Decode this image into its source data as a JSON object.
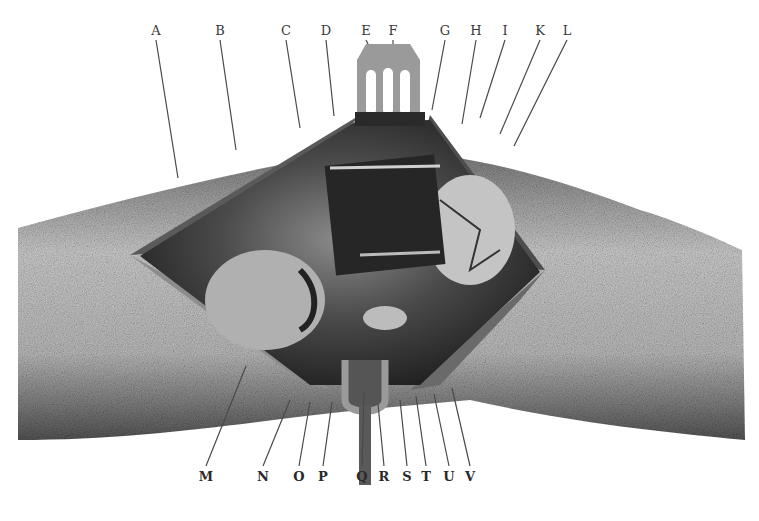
{
  "figure": {
    "colors": {
      "background": "#ffffff",
      "skin_light": "#d6d6d6",
      "skin_dark": "#6e6e6e",
      "cavity": "#2b2b2b",
      "leader": "#4a4a4a"
    },
    "labels_top": [
      {
        "letter": "A",
        "x": 156,
        "y": 24,
        "tx": 178,
        "ty": 178
      },
      {
        "letter": "B",
        "x": 220,
        "y": 24,
        "tx": 236,
        "ty": 150
      },
      {
        "letter": "C",
        "x": 286,
        "y": 24,
        "tx": 300,
        "ty": 128
      },
      {
        "letter": "D",
        "x": 326,
        "y": 24,
        "tx": 334,
        "ty": 116
      },
      {
        "letter": "E",
        "x": 366,
        "y": 24,
        "tx": 368,
        "ty": 44
      },
      {
        "letter": "F",
        "x": 393,
        "y": 24,
        "tx": 393,
        "ty": 44
      },
      {
        "letter": "G",
        "x": 445,
        "y": 24,
        "tx": 432,
        "ty": 110
      },
      {
        "letter": "H",
        "x": 476,
        "y": 24,
        "tx": 462,
        "ty": 124
      },
      {
        "letter": "I",
        "x": 505,
        "y": 24,
        "tx": 480,
        "ty": 118
      },
      {
        "letter": "K",
        "x": 540,
        "y": 24,
        "tx": 500,
        "ty": 134
      },
      {
        "letter": "L",
        "x": 567,
        "y": 24,
        "tx": 514,
        "ty": 146
      }
    ],
    "labels_bottom": [
      {
        "letter": "M",
        "x": 206,
        "y": 470,
        "tx": 246,
        "ty": 366
      },
      {
        "letter": "N",
        "x": 263,
        "y": 470,
        "tx": 290,
        "ty": 400
      },
      {
        "letter": "O",
        "x": 299,
        "y": 470,
        "tx": 310,
        "ty": 402
      },
      {
        "letter": "P",
        "x": 323,
        "y": 470,
        "tx": 332,
        "ty": 402
      },
      {
        "letter": "Q",
        "x": 362,
        "y": 470,
        "tx": 364,
        "ty": 392
      },
      {
        "letter": "R",
        "x": 384,
        "y": 470,
        "tx": 378,
        "ty": 404
      },
      {
        "letter": "S",
        "x": 407,
        "y": 470,
        "tx": 400,
        "ty": 400
      },
      {
        "letter": "T",
        "x": 426,
        "y": 470,
        "tx": 416,
        "ty": 396
      },
      {
        "letter": "U",
        "x": 449,
        "y": 470,
        "tx": 434,
        "ty": 394
      },
      {
        "letter": "V",
        "x": 470,
        "y": 470,
        "tx": 452,
        "ty": 388
      }
    ]
  },
  "labels_top_text": [
    "A",
    "B",
    "C",
    "D",
    "E",
    "F",
    "G",
    "H",
    "I",
    "K",
    "L"
  ],
  "labels_bottom_text": [
    "M",
    "N",
    "O",
    "P",
    "Q",
    "R",
    "S",
    "T",
    "U",
    "V"
  ]
}
